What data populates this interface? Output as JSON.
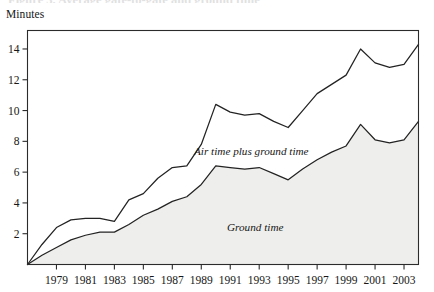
{
  "figure": {
    "name": "airline-flight-time-area-chart",
    "title_remnant": "Figure 3. Average gate-to-gate and ground time",
    "y_axis_title": "Minutes"
  },
  "labels": {
    "upper_series": "Air time plus ground time",
    "lower_series": "Ground time"
  },
  "colors": {
    "line": "#232323",
    "fill": "#eeeeec",
    "frame": "#2b2b2b",
    "text": "#161616"
  },
  "chart_data": {
    "type": "area",
    "title": "",
    "subtitle": "",
    "xlabel": "",
    "ylabel": "Minutes",
    "ylim": [
      0,
      15.2
    ],
    "xlim": [
      1977,
      2004
    ],
    "grid": false,
    "legend_position": "inline-annotation",
    "y_ticks": [
      2,
      4,
      6,
      8,
      10,
      12,
      14
    ],
    "x_ticks": [
      1979,
      1981,
      1983,
      1985,
      1987,
      1989,
      1991,
      1993,
      1995,
      1997,
      1999,
      2001,
      2003
    ],
    "x_tick_labels": [
      "1979",
      "1981",
      "1983",
      "1985",
      "1987",
      "1989",
      "1991",
      "1993",
      "1995",
      "1997",
      "1999",
      "2001",
      "2003"
    ],
    "x": [
      1977,
      1978,
      1979,
      1980,
      1981,
      1982,
      1983,
      1984,
      1985,
      1986,
      1987,
      1988,
      1989,
      1990,
      1991,
      1992,
      1993,
      1994,
      1995,
      1996,
      1997,
      1998,
      1999,
      2000,
      2001,
      2002,
      2003,
      2004
    ],
    "series": [
      {
        "name": "Air time plus ground time",
        "filled": false,
        "values": [
          0.0,
          1.3,
          2.4,
          2.9,
          3.0,
          3.0,
          2.8,
          4.2,
          4.6,
          5.6,
          6.3,
          6.4,
          7.8,
          10.4,
          9.9,
          9.7,
          9.8,
          9.3,
          8.9,
          10.0,
          11.1,
          11.7,
          12.3,
          14.0,
          13.1,
          12.8,
          13.0,
          14.3
        ]
      },
      {
        "name": "Ground time",
        "filled": true,
        "values": [
          0.0,
          0.6,
          1.1,
          1.6,
          1.9,
          2.1,
          2.1,
          2.6,
          3.2,
          3.6,
          4.1,
          4.4,
          5.2,
          6.4,
          6.3,
          6.2,
          6.3,
          5.9,
          5.5,
          6.2,
          6.8,
          7.3,
          7.7,
          9.1,
          8.1,
          7.9,
          8.1,
          9.3
        ]
      }
    ]
  }
}
